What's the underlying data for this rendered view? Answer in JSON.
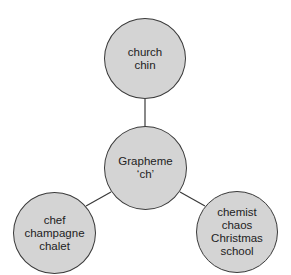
{
  "diagram": {
    "type": "hub-and-spoke",
    "colors": {
      "node_fill": "#d4d4d4",
      "node_stroke": "#3a3a3a",
      "connector": "#3a3a3a",
      "text": "#222222",
      "background": "#ffffff"
    },
    "center": {
      "lines": [
        "Grapheme",
        "‘ch’"
      ]
    },
    "nodes": [
      {
        "id": "top",
        "lines": [
          "church",
          "chin"
        ]
      },
      {
        "id": "left",
        "lines": [
          "chef",
          "champagne",
          "chalet"
        ]
      },
      {
        "id": "right",
        "lines": [
          "chemist",
          "chaos",
          "Christmas",
          "school"
        ]
      }
    ],
    "edges": [
      {
        "from": "center",
        "to": "top"
      },
      {
        "from": "center",
        "to": "left"
      },
      {
        "from": "center",
        "to": "right"
      }
    ]
  }
}
